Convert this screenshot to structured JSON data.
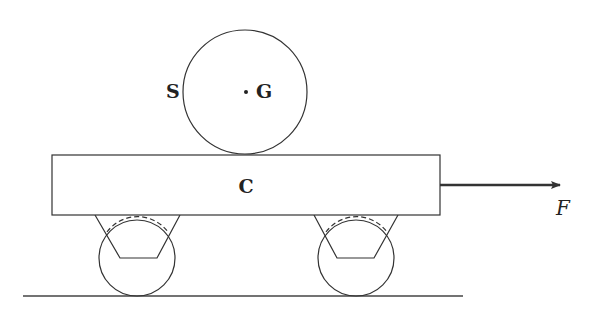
{
  "diagram": {
    "labels": {
      "sphere": "S",
      "center": "G",
      "cart": "C",
      "force": "F"
    },
    "colors": {
      "stroke": "#333333",
      "background": "#ffffff"
    },
    "elements": [
      {
        "id": "sphere",
        "type": "circle",
        "label": "S"
      },
      {
        "id": "center-of-mass",
        "type": "point",
        "label": "G"
      },
      {
        "id": "cart-body",
        "type": "rectangle",
        "label": "C"
      },
      {
        "id": "left-wheel",
        "type": "circle-with-bracket"
      },
      {
        "id": "right-wheel",
        "type": "circle-with-bracket"
      },
      {
        "id": "force-arrow",
        "type": "arrow",
        "label": "F",
        "direction": "right"
      },
      {
        "id": "ground",
        "type": "line"
      }
    ]
  }
}
